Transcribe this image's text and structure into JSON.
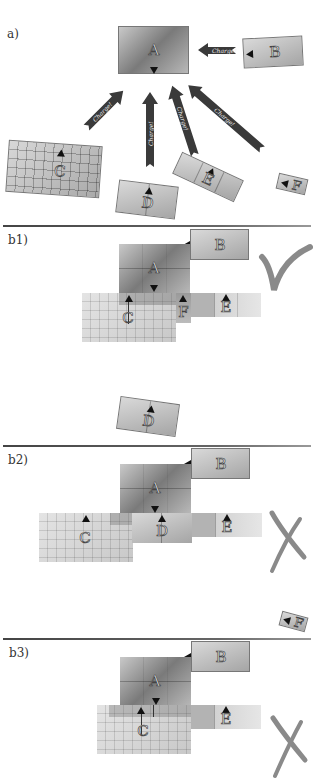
{
  "panels": {
    "a": {
      "label": "a)",
      "arrow_text": "Charge!"
    },
    "b1": {
      "label": "b1)",
      "verdict": "checkmark"
    },
    "b2": {
      "label": "b2)",
      "verdict": "cross"
    },
    "b3": {
      "label": "b3)",
      "verdict": "cross"
    }
  },
  "blocks": {
    "A": "A",
    "B": "B",
    "C": "C",
    "D": "D",
    "E": "E",
    "F": "F"
  },
  "arrows": [
    {
      "from": "B",
      "to": "A",
      "text": "Charge!"
    },
    {
      "from": "C",
      "to": "A",
      "text": "Charge!"
    },
    {
      "from": "D",
      "to": "A",
      "text": "Charge!"
    },
    {
      "from": "E",
      "to": "A",
      "text": "Charge!"
    },
    {
      "from": "F",
      "to": "A",
      "text": "Charge!"
    }
  ],
  "colors": {
    "arrow": "#3a3a3a",
    "verdict_mark": "#8a8a8a",
    "separator": "#555555"
  }
}
